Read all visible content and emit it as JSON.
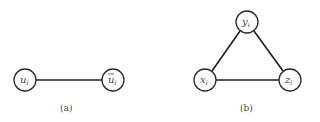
{
  "figure": {
    "a": {
      "caption": "(a)",
      "nodes": [
        {
          "id": "u",
          "base": "u",
          "sub": "i",
          "bar": false,
          "x": 25,
          "y": 80
        },
        {
          "id": "ubar",
          "base": "u",
          "sub": "i",
          "bar": true,
          "x": 113,
          "y": 80
        }
      ],
      "edges": [
        [
          "u",
          "ubar"
        ]
      ]
    },
    "b": {
      "caption": "(b)",
      "nodes": [
        {
          "id": "y",
          "base": "y",
          "sub": "i",
          "x": 247,
          "y": 22
        },
        {
          "id": "x",
          "base": "x",
          "sub": "i",
          "x": 205,
          "y": 80
        },
        {
          "id": "z",
          "base": "z",
          "sub": "i",
          "x": 290,
          "y": 80
        }
      ],
      "edges": [
        [
          "x",
          "y"
        ],
        [
          "y",
          "z"
        ],
        [
          "x",
          "z"
        ]
      ]
    }
  }
}
